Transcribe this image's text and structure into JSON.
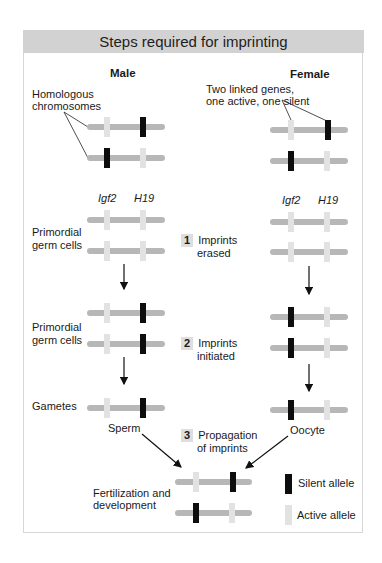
{
  "title": "Steps required for imprinting",
  "columns": {
    "male": "Male",
    "female": "Female"
  },
  "annotations": {
    "homologous": [
      "Homologous",
      "chromosomes"
    ],
    "linked_genes": [
      "Two linked genes,",
      "one active, one silent"
    ]
  },
  "genes": {
    "left": "Igf2",
    "right": "H19"
  },
  "stages": {
    "pgc1": [
      "Primordial",
      "germ cells"
    ],
    "pgc2": [
      "Primordial",
      "germ cells"
    ],
    "gametes": "Gametes",
    "fertilization": [
      "Fertilization and",
      "development"
    ]
  },
  "steps": [
    {
      "num": "1",
      "text": [
        "Imprints",
        "erased"
      ]
    },
    {
      "num": "2",
      "text": [
        "Imprints",
        "initiated"
      ]
    },
    {
      "num": "3",
      "text": [
        "Propagation",
        "of imprints"
      ]
    }
  ],
  "gamete_labels": {
    "sperm": "Sperm",
    "oocyte": "Oocyte"
  },
  "legend": [
    {
      "label": "Silent allele",
      "color": "#0d0d0d"
    },
    {
      "label": "Active allele",
      "color": "#e2e2e2"
    }
  ],
  "colors": {
    "header_bg": "#d2d2d2",
    "chromosome": "#b7b7b7",
    "silent": "#0d0d0d",
    "active": "#e2e2e2"
  }
}
